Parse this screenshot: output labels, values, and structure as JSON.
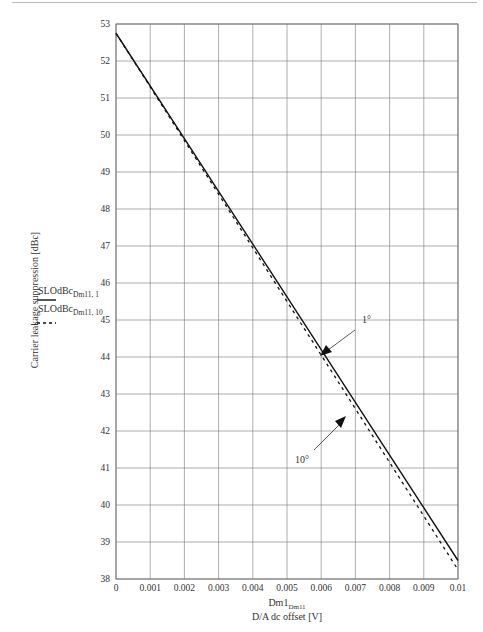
{
  "chart_data": {
    "type": "line",
    "title": "",
    "xlabel": "Dm1_Dm11",
    "xlabel_line2": "D/A dc offset [V]",
    "ylabel": "Carrier leakage suppression [dBc]",
    "xlim": [
      0,
      0.01
    ],
    "ylim": [
      38,
      53
    ],
    "grid": true,
    "x_ticks": [
      "0",
      "0.001",
      "0.002",
      "0.003",
      "0.004",
      "0.005",
      "0.006",
      "0.007",
      "0.008",
      "0.009",
      "0.01"
    ],
    "y_ticks": [
      "38",
      "39",
      "40",
      "41",
      "42",
      "43",
      "44",
      "45",
      "46",
      "47",
      "48",
      "49",
      "50",
      "51",
      "52",
      "53"
    ],
    "legend_position": "left",
    "series": [
      {
        "name": "SLOdBc_Dm11,1",
        "style": "solid",
        "x": [
          0,
          0.002,
          0.004,
          0.006,
          0.008,
          0.01
        ],
        "values": [
          52.75,
          49.9,
          47.05,
          44.2,
          41.35,
          38.5
        ]
      },
      {
        "name": "SLOdBc_Dm11,10",
        "style": "dashed",
        "x": [
          0,
          0.002,
          0.004,
          0.006,
          0.008,
          0.01
        ],
        "values": [
          52.75,
          49.85,
          46.95,
          44.05,
          41.15,
          38.25
        ]
      }
    ],
    "annotations": [
      {
        "text": "1°",
        "points_to": [
          0.006,
          44.1
        ]
      },
      {
        "text": "10°",
        "points_to": [
          0.0069,
          42.7
        ]
      }
    ]
  },
  "labels": {
    "ylabel": "Carrier leakage suppression [dBc]",
    "xlabel_main": "Dm1",
    "xlabel_sub": "Dm11",
    "xlabel_line2": "D/A dc offset [V]",
    "legend_1_main": "SLOdBc",
    "legend_1_sub": "Dm11, 1",
    "legend_2_main": "SLOdBc",
    "legend_2_sub": "Dm11, 10",
    "annot_1": "1°",
    "annot_10": "10°"
  }
}
